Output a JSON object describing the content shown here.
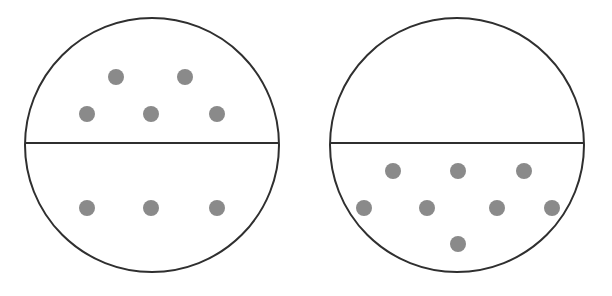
{
  "colors": {
    "background": "#ffffff",
    "outline": "#2f2f2f",
    "dot": "#8a8a8a"
  },
  "diagrams": [
    {
      "name": "left-container",
      "circle": {
        "cx": 152,
        "cy": 145,
        "r": 127
      },
      "divider_y": 143,
      "upper_dots": [
        [
          116,
          77
        ],
        [
          185,
          77
        ],
        [
          87,
          114
        ],
        [
          151,
          114
        ],
        [
          217,
          114
        ]
      ],
      "lower_dots": [
        [
          87,
          208
        ],
        [
          151,
          208
        ],
        [
          217,
          208
        ]
      ],
      "upper_count": 5,
      "lower_count": 3
    },
    {
      "name": "right-container",
      "circle": {
        "cx": 457,
        "cy": 145,
        "r": 127
      },
      "divider_y": 143,
      "upper_dots": [],
      "lower_dots": [
        [
          393,
          171
        ],
        [
          458,
          171
        ],
        [
          524,
          171
        ],
        [
          364,
          208
        ],
        [
          427,
          208
        ],
        [
          497,
          208
        ],
        [
          552,
          208
        ],
        [
          458,
          244
        ]
      ],
      "upper_count": 0,
      "lower_count": 8
    }
  ],
  "dot_radius": 8
}
